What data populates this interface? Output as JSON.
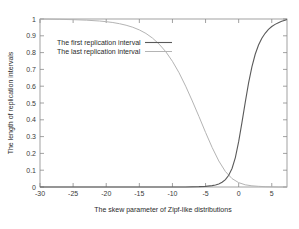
{
  "chart_data": {
    "type": "line",
    "title": "",
    "xlabel": "The skew parameter of Zipf-like distributions",
    "ylabel": "The length of replication intervals",
    "xlim": [
      -30,
      7.3
    ],
    "ylim": [
      0,
      1
    ],
    "grid": false,
    "legend_position": "top-left",
    "xticks": [
      -30,
      -25,
      -20,
      -15,
      -10,
      -5,
      0,
      5
    ],
    "xtick_labels": [
      "-30",
      "-25",
      "-20",
      "-15",
      "-10",
      "-5",
      "0",
      "5"
    ],
    "yticks": [
      0,
      0.1,
      0.2,
      0.3,
      0.4,
      0.5,
      0.6,
      0.7,
      0.8,
      0.9,
      1
    ],
    "ytick_labels": [
      "0",
      "0.1",
      "0.2",
      "0.3",
      "0.4",
      "0.5",
      "0.6",
      "0.7",
      "0.8",
      "0.9",
      "1"
    ],
    "series": [
      {
        "name": "The first replication interval",
        "color": "#5a5a5a",
        "x": [
          -30,
          -25,
          -20,
          -15,
          -12,
          -10,
          -8,
          -6,
          -5,
          -4,
          -3.5,
          -3,
          -2.5,
          -2,
          -1.5,
          -1,
          -0.5,
          0,
          0.5,
          1,
          1.5,
          2,
          2.5,
          3,
          3.5,
          4,
          4.5,
          5,
          5.5,
          6,
          6.5,
          7,
          7.3
        ],
        "values": [
          0.0,
          0.0,
          0.0,
          0.0,
          0.0,
          0.0,
          0.0,
          0.002,
          0.004,
          0.008,
          0.012,
          0.018,
          0.028,
          0.044,
          0.07,
          0.11,
          0.175,
          0.27,
          0.385,
          0.505,
          0.62,
          0.715,
          0.79,
          0.845,
          0.885,
          0.915,
          0.938,
          0.955,
          0.968,
          0.978,
          0.986,
          0.993,
          0.997
        ]
      },
      {
        "name": "The last replication interval",
        "color": "#b4b4b4",
        "x": [
          -30,
          -27,
          -25,
          -23,
          -21,
          -20,
          -19,
          -18,
          -17,
          -16,
          -15,
          -14,
          -13,
          -12,
          -11,
          -10,
          -9,
          -8,
          -7,
          -6,
          -5,
          -4,
          -3,
          -2,
          -1,
          0,
          1,
          2,
          3,
          4,
          5,
          6,
          7,
          7.3
        ],
        "values": [
          1.0,
          0.998,
          0.996,
          0.993,
          0.988,
          0.984,
          0.979,
          0.972,
          0.963,
          0.951,
          0.935,
          0.914,
          0.886,
          0.85,
          0.805,
          0.748,
          0.68,
          0.6,
          0.512,
          0.42,
          0.325,
          0.235,
          0.155,
          0.092,
          0.05,
          0.026,
          0.013,
          0.007,
          0.004,
          0.002,
          0.001,
          0.0,
          0.0,
          0.0
        ]
      }
    ]
  },
  "legend": {
    "entries": [
      {
        "label": "The first replication interval"
      },
      {
        "label": "The last replication interval"
      }
    ]
  }
}
